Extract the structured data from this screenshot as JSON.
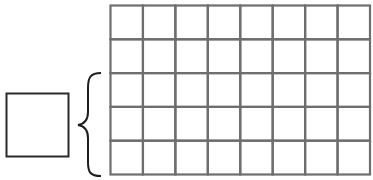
{
  "diagram": {
    "grid": {
      "rows": 5,
      "columns": 8
    },
    "brace": {
      "spans_rows_from_bottom": 3
    },
    "single_square": {
      "count": 1
    },
    "colors": {
      "grid_line": "#6e6e6e",
      "square_line": "#2a2a2a",
      "brace": "#1e1e1e",
      "background": "#ffffff"
    }
  }
}
